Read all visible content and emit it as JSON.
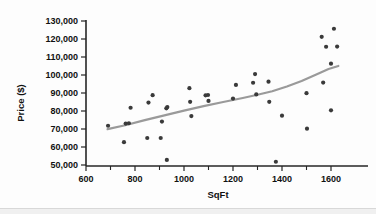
{
  "chart_data": {
    "type": "scatter",
    "title": "",
    "xlabel": "SqFt",
    "ylabel": "Price ($)",
    "xlim": [
      550,
      1680
    ],
    "ylim": [
      45000,
      132000
    ],
    "grid": false,
    "legend": "none",
    "x_ticks": [
      600,
      800,
      1000,
      1200,
      1400,
      1600
    ],
    "x_tick_labels": [
      "600",
      "800",
      "1000",
      "1200",
      "1400",
      "1600"
    ],
    "x_minor_ticks": [
      700,
      900,
      1100,
      1300,
      1500
    ],
    "y_ticks": [
      50000,
      60000,
      70000,
      80000,
      90000,
      100000,
      110000,
      120000,
      130000
    ],
    "y_tick_labels": [
      "50,000",
      "60,000",
      "70,000",
      "80,000",
      "90,000",
      "100,000",
      "110,000",
      "120,000",
      "130,000"
    ],
    "series": [
      {
        "name": "Homes",
        "marker": "filled-circle",
        "color": "#3a3a3a",
        "points": [
          [
            690,
            71800
          ],
          [
            755,
            62700
          ],
          [
            762,
            73000
          ],
          [
            775,
            73200
          ],
          [
            782,
            81800
          ],
          [
            850,
            65000
          ],
          [
            855,
            84700
          ],
          [
            872,
            88800
          ],
          [
            905,
            65000
          ],
          [
            910,
            74100
          ],
          [
            928,
            81500
          ],
          [
            932,
            82200
          ],
          [
            930,
            52800
          ],
          [
            1022,
            92700
          ],
          [
            1025,
            85100
          ],
          [
            1030,
            77200
          ],
          [
            1098,
            88900
          ],
          [
            1100,
            85600
          ],
          [
            1088,
            88700
          ],
          [
            1200,
            86900
          ],
          [
            1212,
            94500
          ],
          [
            1282,
            95700
          ],
          [
            1290,
            100500
          ],
          [
            1295,
            89200
          ],
          [
            1345,
            96300
          ],
          [
            1348,
            85100
          ],
          [
            1375,
            51800
          ],
          [
            1400,
            77400
          ],
          [
            1500,
            89900
          ],
          [
            1502,
            70200
          ],
          [
            1562,
            121200
          ],
          [
            1568,
            95800
          ],
          [
            1580,
            115700
          ],
          [
            1600,
            106300
          ],
          [
            1600,
            80400
          ],
          [
            1612,
            125700
          ],
          [
            1625,
            115800
          ]
        ]
      }
    ],
    "smoother": {
      "name": "lowess-trend",
      "color": "#9a9a9a",
      "points": [
        [
          688,
          69900
        ],
        [
          760,
          72100
        ],
        [
          840,
          74900
        ],
        [
          920,
          77600
        ],
        [
          1000,
          80200
        ],
        [
          1080,
          82700
        ],
        [
          1160,
          85000
        ],
        [
          1240,
          87200
        ],
        [
          1300,
          89000
        ],
        [
          1360,
          91000
        ],
        [
          1420,
          93600
        ],
        [
          1480,
          96700
        ],
        [
          1540,
          100300
        ],
        [
          1590,
          103300
        ],
        [
          1630,
          105000
        ]
      ]
    }
  }
}
